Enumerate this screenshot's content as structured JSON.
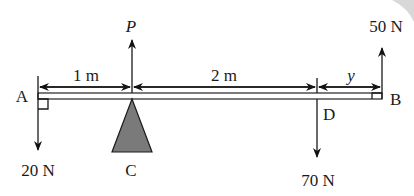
{
  "diagram": {
    "type": "beam-moments",
    "beam": {
      "length_note": "uniform beam AB",
      "points": [
        "A",
        "C",
        "D",
        "B"
      ]
    },
    "points": {
      "A": {
        "label": "A"
      },
      "B": {
        "label": "B"
      },
      "C": {
        "label": "C",
        "role": "pivot support"
      },
      "D": {
        "label": "D"
      }
    },
    "forces": {
      "P": {
        "label": "P",
        "direction": "up",
        "at": "C"
      },
      "fA": {
        "label": "20 N",
        "direction": "down",
        "at": "A"
      },
      "fD": {
        "label": "70 N",
        "direction": "down",
        "at": "D"
      },
      "fB": {
        "label": "50 N",
        "direction": "up",
        "at": "B"
      }
    },
    "dimensions": {
      "AC": {
        "label": "1 m"
      },
      "CD": {
        "label": "2 m"
      },
      "DB": {
        "label": "y"
      }
    },
    "colors": {
      "ink": "#1a1a1a",
      "support_fill": "#7a7a7a",
      "background": "#ffffff"
    }
  }
}
